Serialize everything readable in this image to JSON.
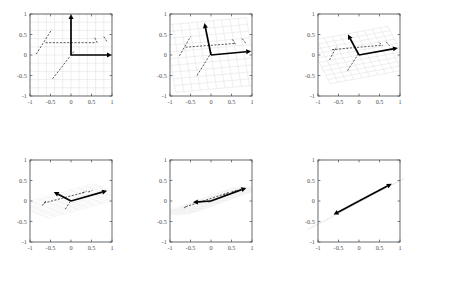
{
  "figure": {
    "title": "",
    "panel_count": 6,
    "layout": {
      "rows": 2,
      "cols": 3
    },
    "colors": {
      "axis": "#555a5e",
      "tick_label": "#4b4f52",
      "mesh": "#dcdcdc",
      "mesh_faint": "#e8e8e8",
      "dashed_data": "#2b2b2b",
      "basis_vector": "#000000",
      "collapse_line": "#d8d8d8",
      "background": "#ffffff"
    }
  },
  "chart_data": {
    "type": "scatter",
    "title": "",
    "xlabel": "",
    "ylabel": "",
    "xlim": [
      -1,
      1
    ],
    "ylim": [
      -1,
      1
    ],
    "grid": true,
    "legend": "none",
    "panels": [
      {
        "index": 1,
        "name": "panel-1",
        "xticks": [
          -1,
          -0.5,
          0,
          0.5,
          1
        ],
        "xticklabels": [
          "-1",
          "-0.5",
          "0",
          "0.5",
          "1"
        ],
        "yticks": [
          -1,
          -0.5,
          0,
          0.5,
          1
        ],
        "yticklabels": [
          "-1",
          "-0.5",
          "0",
          "0.5",
          "1"
        ],
        "mesh": {
          "e1": [
            1.0,
            0.0
          ],
          "e2": [
            0.0,
            1.0
          ],
          "extent": 1.0,
          "divisions": 10
        },
        "basis_vectors": [
          {
            "name": "v1",
            "from": [
              0,
              0
            ],
            "to": [
              1.0,
              0.0
            ]
          },
          {
            "name": "v2",
            "from": [
              0,
              0
            ],
            "to": [
              0.0,
              1.0
            ]
          }
        ],
        "dashed_segments": [
          {
            "from": [
              -0.85,
              0.02
            ],
            "to": [
              -0.47,
              0.62
            ]
          },
          {
            "from": [
              -0.62,
              0.3
            ],
            "to": [
              0.6,
              0.3
            ]
          },
          {
            "from": [
              -0.45,
              -0.58
            ],
            "to": [
              0.08,
              0.1
            ]
          },
          {
            "from": [
              0.58,
              0.42
            ],
            "to": [
              0.64,
              0.3
            ]
          },
          {
            "from": [
              0.8,
              0.45
            ],
            "to": [
              0.88,
              0.32
            ]
          }
        ]
      },
      {
        "index": 2,
        "name": "panel-2",
        "xticks": [
          -1,
          -0.5,
          0,
          0.5,
          1
        ],
        "xticklabels": [
          "-1",
          "-0.5",
          "0",
          "0.5",
          "1"
        ],
        "yticks": [
          -1,
          -0.5,
          0,
          0.5,
          1
        ],
        "yticklabels": [
          "-1",
          "-0.5",
          "0",
          "0.5",
          "1"
        ],
        "mesh": {
          "e1": [
            1.0,
            0.09
          ],
          "e2": [
            -0.14,
            0.82
          ],
          "extent": 1.0,
          "divisions": 10
        },
        "basis_vectors": [
          {
            "name": "v1",
            "from": [
              0,
              0
            ],
            "to": [
              0.98,
              0.09
            ]
          },
          {
            "name": "v2",
            "from": [
              0,
              0
            ],
            "to": [
              -0.16,
              0.78
            ]
          }
        ],
        "dashed_segments": [
          {
            "from": [
              -0.77,
              -0.02
            ],
            "to": [
              -0.5,
              0.45
            ]
          },
          {
            "from": [
              -0.62,
              0.19
            ],
            "to": [
              0.58,
              0.28
            ]
          },
          {
            "from": [
              -0.34,
              -0.5
            ],
            "to": [
              0.02,
              0.08
            ]
          },
          {
            "from": [
              0.52,
              0.38
            ],
            "to": [
              0.6,
              0.26
            ]
          },
          {
            "from": [
              0.76,
              0.4
            ],
            "to": [
              0.86,
              0.27
            ]
          }
        ]
      },
      {
        "index": 3,
        "name": "panel-3",
        "xticks": [
          -1,
          -0.5,
          0,
          0.5,
          1
        ],
        "xticklabels": [
          "-1",
          "-0.5",
          "0",
          "0.5",
          "1"
        ],
        "yticks": [
          -1,
          -0.5,
          0,
          0.5,
          1
        ],
        "yticklabels": [
          "-1",
          "-0.5",
          "0",
          "0.5",
          "1"
        ],
        "mesh": {
          "e1": [
            0.97,
            0.18
          ],
          "e2": [
            -0.26,
            0.52
          ],
          "extent": 1.0,
          "divisions": 10
        },
        "basis_vectors": [
          {
            "name": "v1",
            "from": [
              0,
              0
            ],
            "to": [
              0.95,
              0.17
            ]
          },
          {
            "name": "v2",
            "from": [
              0,
              0
            ],
            "to": [
              -0.27,
              0.5
            ]
          }
        ],
        "dashed_segments": [
          {
            "from": [
              -0.72,
              -0.12
            ],
            "to": [
              -0.55,
              0.2
            ]
          },
          {
            "from": [
              -0.66,
              0.13
            ],
            "to": [
              0.56,
              0.24
            ]
          },
          {
            "from": [
              -0.28,
              -0.38
            ],
            "to": [
              0.0,
              0.05
            ]
          },
          {
            "from": [
              0.5,
              0.3
            ],
            "to": [
              0.58,
              0.22
            ]
          },
          {
            "from": [
              0.66,
              0.32
            ],
            "to": [
              0.74,
              0.23
            ]
          }
        ]
      },
      {
        "index": 4,
        "name": "panel-4",
        "xticks": [
          -1,
          -0.5,
          0,
          0.5,
          1
        ],
        "xticklabels": [
          "-1",
          "-0.5",
          "0",
          "0.5",
          "1"
        ],
        "yticks": [
          -1,
          -0.5,
          0,
          0.5,
          1
        ],
        "yticklabels": [
          "-1",
          "-0.5",
          "0",
          "0.5",
          "1"
        ],
        "mesh": {
          "e1": [
            0.95,
            0.26
          ],
          "e2": [
            -0.4,
            0.16
          ],
          "extent": 1.0,
          "divisions": 10
        },
        "basis_vectors": [
          {
            "name": "v1",
            "from": [
              0,
              0
            ],
            "to": [
              0.88,
              0.25
            ]
          },
          {
            "name": "v2",
            "from": [
              0,
              0
            ],
            "to": [
              -0.42,
              0.22
            ]
          }
        ],
        "dashed_segments": [
          {
            "from": [
              -0.7,
              -0.11
            ],
            "to": [
              -0.6,
              0.02
            ]
          },
          {
            "from": [
              -0.66,
              -0.05
            ],
            "to": [
              0.36,
              0.22
            ]
          },
          {
            "from": [
              -0.14,
              -0.2
            ],
            "to": [
              0.0,
              0.02
            ]
          },
          {
            "from": [
              0.28,
              0.2
            ],
            "to": [
              0.38,
              0.24
            ]
          },
          {
            "from": [
              0.42,
              0.22
            ],
            "to": [
              0.52,
              0.26
            ]
          }
        ]
      },
      {
        "index": 5,
        "name": "panel-5",
        "xticks": [
          -1,
          -0.5,
          0,
          0.5,
          1
        ],
        "xticklabels": [
          "-1",
          "-0.5",
          "0",
          "0.5",
          "1"
        ],
        "yticks": [
          -1,
          -0.5,
          0,
          0.5,
          1
        ],
        "yticklabels": [
          "-1",
          "-0.5",
          "0",
          "0.5",
          "1"
        ],
        "mesh": {
          "e1": [
            0.92,
            0.33
          ],
          "e2": [
            -0.42,
            -0.02
          ],
          "extent": 1.0,
          "divisions": 10
        },
        "basis_vectors": [
          {
            "name": "v1",
            "from": [
              0,
              0
            ],
            "to": [
              0.86,
              0.32
            ]
          },
          {
            "name": "v2",
            "from": [
              0,
              0
            ],
            "to": [
              -0.44,
              -0.03
            ]
          }
        ],
        "dashed_segments": [
          {
            "from": [
              -0.66,
              -0.17
            ],
            "to": [
              -0.58,
              -0.12
            ]
          },
          {
            "from": [
              -0.62,
              -0.14
            ],
            "to": [
              0.42,
              0.2
            ]
          },
          {
            "from": [
              -0.05,
              -0.04
            ],
            "to": [
              0.02,
              0.03
            ]
          },
          {
            "from": [
              0.3,
              0.15
            ],
            "to": [
              0.44,
              0.21
            ]
          },
          {
            "from": [
              0.5,
              0.22
            ],
            "to": [
              0.62,
              0.26
            ]
          }
        ]
      },
      {
        "index": 6,
        "name": "panel-6",
        "xticks": [
          -1,
          -0.5,
          0,
          0.5,
          1
        ],
        "xticklabels": [
          "-1",
          "-0.5",
          "0",
          "0.5",
          "1"
        ],
        "yticks": [
          -1,
          -0.5,
          0,
          0.5,
          1
        ],
        "yticklabels": [
          "-1",
          "-0.5",
          "0",
          "0.5",
          "1"
        ],
        "mesh": null,
        "collapse_line": {
          "from": [
            -1.25,
            -0.7
          ],
          "to": [
            1.25,
            0.63
          ],
          "slope": 0.53
        },
        "basis_vectors": [
          {
            "name": "v1",
            "from": [
              0,
              0
            ],
            "to": [
              0.8,
              0.42
            ]
          },
          {
            "name": "v2",
            "from": [
              0,
              0
            ],
            "to": [
              -0.62,
              -0.33
            ]
          }
        ],
        "dashed_segments": []
      }
    ]
  }
}
